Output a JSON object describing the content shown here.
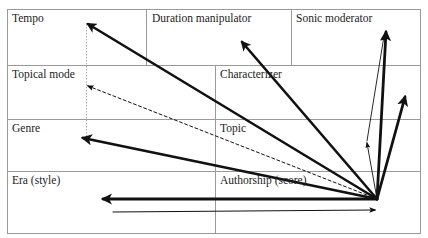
{
  "diagram": {
    "grid": {
      "row1": [
        {
          "label": "Tempo"
        },
        {
          "label": "Duration manipulator"
        },
        {
          "label": "Sonic moderator"
        }
      ],
      "row2": [
        {
          "label": "Topical mode"
        },
        {
          "label": "Characterizer"
        }
      ],
      "row3": [
        {
          "label": "Genre"
        },
        {
          "label": "Topic"
        }
      ],
      "row4": [
        {
          "label": "Era (style)"
        },
        {
          "label": "Authorship (score)"
        }
      ]
    },
    "colors": {
      "grid_line": "#9a9a9a",
      "arrow": "#111111",
      "dotted_guide": "#b0b0b0"
    },
    "origin": {
      "x": 377,
      "y": 199
    },
    "arrows": [
      {
        "name": "arrow-to-tempo",
        "from": [
          377,
          199
        ],
        "to": [
          86,
          23
        ],
        "weight": "thick",
        "style": "solid"
      },
      {
        "name": "arrow-to-topical-mode",
        "from": [
          377,
          199
        ],
        "to": [
          86,
          85
        ],
        "weight": "thin",
        "style": "dashed"
      },
      {
        "name": "arrow-to-genre",
        "from": [
          377,
          199
        ],
        "to": [
          81,
          137
        ],
        "weight": "thick",
        "style": "solid"
      },
      {
        "name": "arrow-to-era",
        "from": [
          377,
          199
        ],
        "to": [
          101,
          199
        ],
        "weight": "thick",
        "style": "solid"
      },
      {
        "name": "arrow-to-duration-manipulator",
        "from": [
          377,
          199
        ],
        "to": [
          240,
          40
        ],
        "weight": "thick",
        "style": "solid"
      },
      {
        "name": "arrow-to-sonic-moderator",
        "from": [
          377,
          199
        ],
        "to": [
          386,
          30
        ],
        "weight": "thick",
        "style": "solid"
      },
      {
        "name": "arrow-right-upper",
        "from": [
          377,
          199
        ],
        "to": [
          406,
          95
        ],
        "weight": "thick",
        "style": "solid"
      },
      {
        "name": "arrow-thin-mid",
        "from": [
          377,
          199
        ],
        "to": [
          366,
          141
        ],
        "weight": "thin",
        "style": "solid"
      },
      {
        "name": "arrow-thin-to-sonic",
        "from": [
          366,
          141
        ],
        "to": [
          384,
          34
        ],
        "weight": "thin",
        "style": "solid"
      },
      {
        "name": "arrow-bottom-right",
        "from": [
          113,
          212
        ],
        "to": [
          377,
          210
        ],
        "weight": "thin",
        "style": "solid"
      }
    ]
  }
}
